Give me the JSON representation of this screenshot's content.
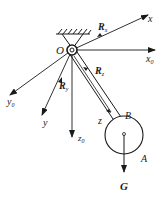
{
  "diagram": {
    "colors": {
      "stroke": "#1a1a1a",
      "background": "#ffffff"
    },
    "labels": {
      "origin": "O",
      "x_axis": "x",
      "x0_axis": "x",
      "x0_sub": "0",
      "y0_axis": "y",
      "y0_sub": "0",
      "y_axis": "y",
      "z0_axis": "z",
      "z0_sub": "0",
      "z_axis": "z",
      "point_B": "B",
      "point_A": "A",
      "gravity": "G",
      "reaction_x": "R",
      "reaction_x_sub": "x",
      "reaction_z": "R",
      "reaction_z_sub": "z",
      "reaction_y": "R",
      "reaction_y_sub": "y"
    }
  }
}
